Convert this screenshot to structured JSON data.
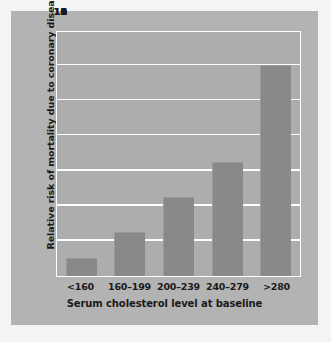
{
  "chart_data": {
    "type": "bar",
    "title": "",
    "categories": [
      "<160",
      "160–199",
      "200–239",
      "240–279",
      ">280"
    ],
    "values": [
      1.0,
      2.5,
      4.5,
      6.5,
      12.0
    ],
    "xlabel": "Serum cholesterol level at baseline",
    "ylabel": "Relative risk of mortality due to coronary disease",
    "ylim": [
      0,
      14
    ],
    "yticks": [
      0,
      2,
      4,
      6,
      8,
      10,
      12,
      14
    ],
    "ytick_labels": [
      "0",
      "2",
      "4",
      "6",
      "8",
      "10",
      "12",
      "14"
    ],
    "grid": "horizontal",
    "legend": "none",
    "colors": {
      "bar": "#898989",
      "plot_background": "#adadad",
      "panel_background": "#b3b3b3",
      "figure_background": "#f4f4f2",
      "gridline": "#ffffff",
      "text": "#1a1a1a"
    }
  }
}
